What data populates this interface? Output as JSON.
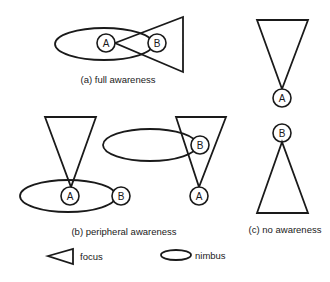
{
  "panels": {
    "a": {
      "caption": "(a) full awareness",
      "nodes": [
        {
          "id": "A",
          "label": "A"
        },
        {
          "id": "B",
          "label": "B"
        }
      ]
    },
    "b": {
      "caption": "(b) peripheral awareness",
      "left": {
        "nodes": [
          {
            "id": "A",
            "label": "A"
          },
          {
            "id": "B",
            "label": "B"
          }
        ]
      },
      "right": {
        "nodes": [
          {
            "id": "B",
            "label": "B"
          },
          {
            "id": "A",
            "label": "A"
          }
        ]
      }
    },
    "c": {
      "caption": "(c) no awareness",
      "nodes": [
        {
          "id": "A",
          "label": "A"
        },
        {
          "id": "B",
          "label": "B"
        }
      ]
    }
  },
  "legend": {
    "focus": {
      "label": "focus",
      "shape": "triangle"
    },
    "nimbus": {
      "label": "nimbus",
      "shape": "ellipse"
    }
  },
  "colors": {
    "stroke": "#1a1a1a",
    "background": "#ffffff"
  }
}
